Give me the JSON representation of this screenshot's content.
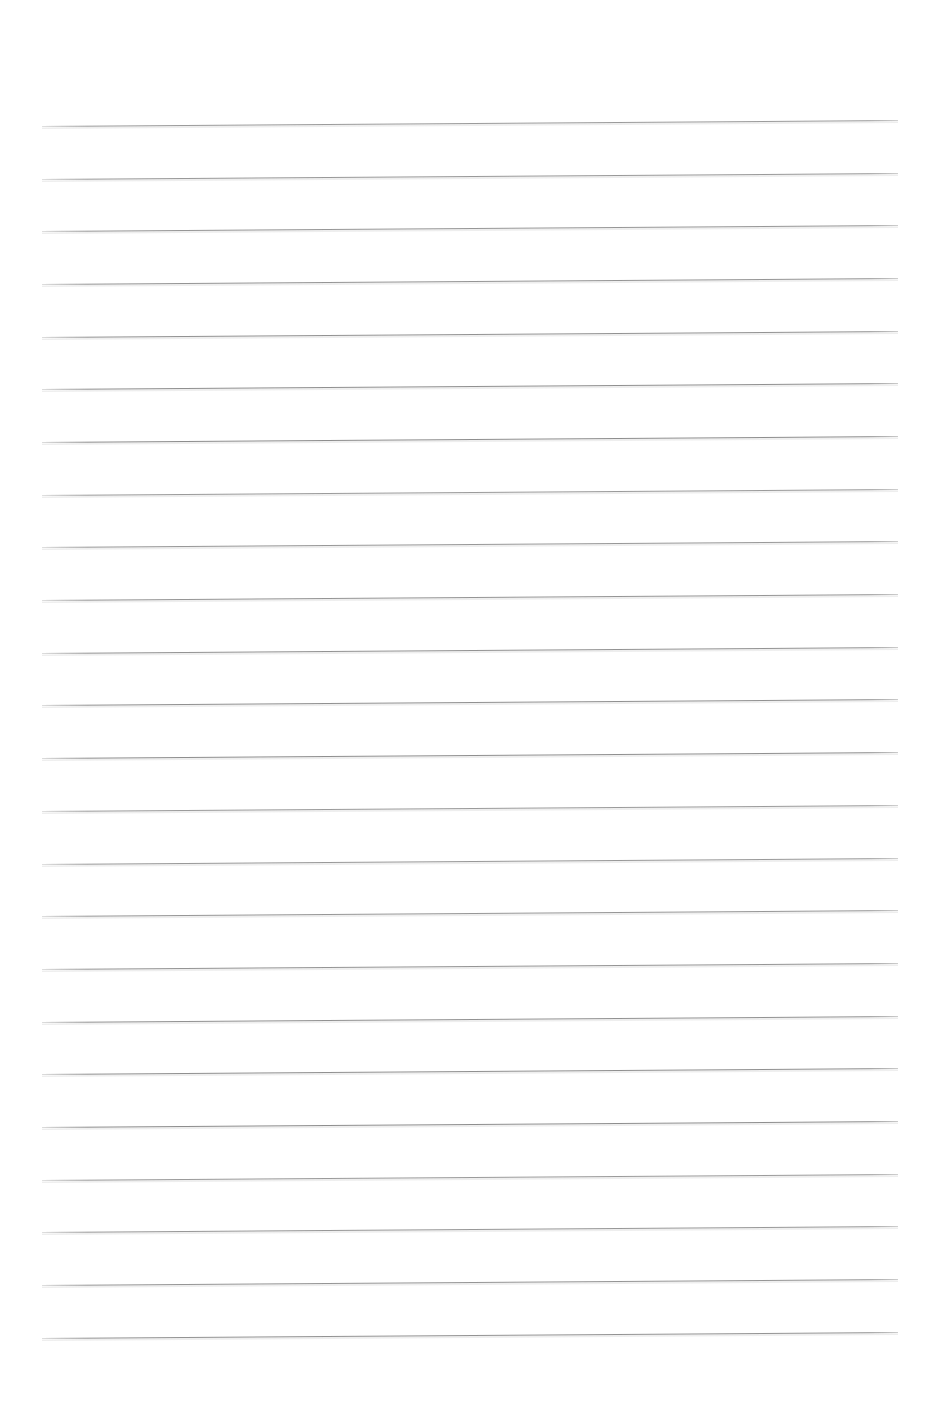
{
  "document": {
    "kind": "scanned-lined-paper",
    "title": "Blank Ruled Writing Paper",
    "orientation": "portrait",
    "page_width_px": 944,
    "page_height_px": 1409,
    "background_color": "#ffffff",
    "has_text_content": false,
    "has_margin_rule": false,
    "has_header": false,
    "has_footer": false,
    "visible_text": ""
  },
  "ruling": {
    "line_color": "#8a8a8a",
    "line_thickness_px": 1,
    "line_count": 24,
    "left_x_px": 42,
    "right_x_px": 898,
    "line_length_px": 856,
    "first_line_y_px": 126,
    "last_line_y_px": 1337,
    "line_spacing_px": 52.7,
    "skew_degrees": -0.4,
    "top_margin_px": 126,
    "bottom_margin_px": 72,
    "left_margin_px": 42,
    "right_margin_px": 46,
    "line_y_positions": [
      126.0,
      178.7,
      231.4,
      284.0,
      336.7,
      389.4,
      442.1,
      494.7,
      547.4,
      600.1,
      652.8,
      705.4,
      758.1,
      810.8,
      863.5,
      916.1,
      968.8,
      1021.5,
      1074.2,
      1126.8,
      1179.5,
      1232.2,
      1284.9,
      1337.5
    ]
  }
}
